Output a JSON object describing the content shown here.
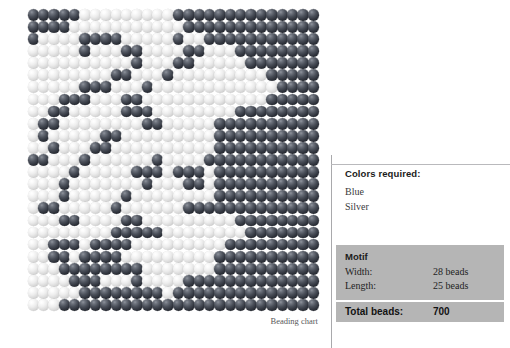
{
  "chart": {
    "caption": "Beading chart",
    "colors": {
      "blue_hex": "#32363f",
      "silver_hex": "#dadada",
      "background_hex": "#ffffff"
    }
  },
  "chart_data": {
    "type": "heatmap",
    "title": "Beading chart",
    "xlabel": "Width (beads)",
    "ylabel": "Length (beads)",
    "cols": 28,
    "rows": 25,
    "legend": [
      "Silver",
      "Blue"
    ],
    "value_map": {
      "0": "Silver",
      "1": "Blue"
    },
    "grid": [
      "1111100000000011111111111111",
      "1111000000000001111111111111",
      "1000011110000010011111111111",
      "0000010001100001100011111111",
      "0000000000100011000001111111",
      "0000000011000100000000011111",
      "0000011100010000000000001111",
      "0001110001100000000000011111",
      "0011000001110000000011111111",
      "0110000000011000001111111111",
      "0100000110000000001111111111",
      "0010001100000000001111111111",
      "1100010000001000011111111111",
      "0000100000111011101111111111",
      "0001000000010001101111111111",
      "0001000001000000001111111111",
      "0110000010000001111111111111",
      "0001100001100000000011111111",
      "0000000011111000000001111111",
      "0011101111000000000111111111",
      "0011011110000000001111111111",
      "0001111111100000001111111111",
      "0000111000100001111111111111",
      "0000011111111011111111111111",
      "0001111111111111111111111111"
    ]
  },
  "legend": {
    "title": "Colors required:",
    "items": [
      {
        "name": "Blue",
        "swatch": "blue"
      },
      {
        "name": "Silver",
        "swatch": "silver"
      }
    ]
  },
  "motif": {
    "heading": "Motif",
    "rows": [
      {
        "label": "Width:",
        "value": "28 beads"
      },
      {
        "label": "Length:",
        "value": "25 beads"
      }
    ],
    "total": {
      "label": "Total beads:",
      "value": "700"
    }
  }
}
